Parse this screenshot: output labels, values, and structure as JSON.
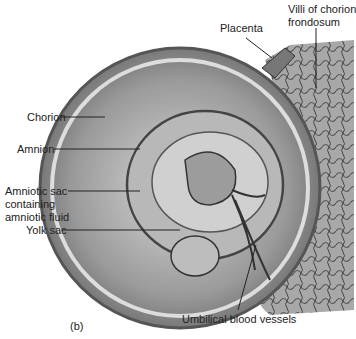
{
  "figure": {
    "panel_label": "(b)",
    "labels": {
      "placenta": "Placenta",
      "villi_1": "Villi of chorion",
      "villi_2": "frondosum",
      "chorion": "Chorion",
      "amnion": "Amnion",
      "amniotic_1": "Amniotic sac",
      "amniotic_2": "containing",
      "amniotic_3": "amniotic fluid",
      "yolk_sac": "Yolk sac",
      "umbilical": "Umbilical blood vessels"
    },
    "colors": {
      "ink": "#222222",
      "tissue_dark": "#555555",
      "tissue_mid": "#999999",
      "tissue_light": "#cccccc",
      "placenta": "#8a8a8a"
    }
  }
}
